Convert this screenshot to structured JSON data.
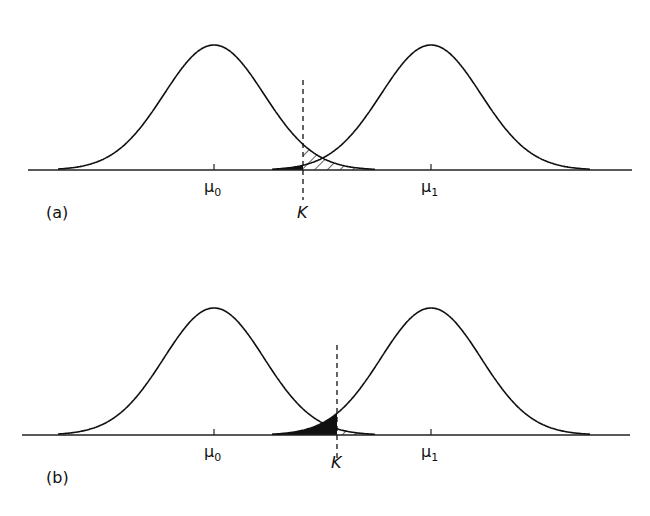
{
  "figure": {
    "colors": {
      "ink": "#111111",
      "background": "#ffffff"
    },
    "legend_semantics": {
      "black_area": "type II error region (beta) under the mu_1 distribution left of K",
      "hatched_area": "type I error region (alpha) under the mu_0 distribution right of K"
    },
    "panels": [
      {
        "id": "a",
        "label": "(a)",
        "mu0_label": "μ",
        "mu0_sub": "0",
        "mu1_label": "μ",
        "mu1_sub": "1",
        "k_label": "K",
        "geometry": {
          "baseline_y": 170,
          "peak_height": 125,
          "sigma": 50,
          "mu0_x": 214,
          "mu1_x": 431,
          "k_x": 303,
          "axis_x0": 28,
          "axis_x1": 632,
          "curve0_x0": 58,
          "curve0_x1": 375,
          "curve1_x0": 272,
          "curve1_x1": 590,
          "k_y0": 80,
          "k_y1": 200,
          "label_y": 218
        }
      },
      {
        "id": "b",
        "label": "(b)",
        "mu0_label": "μ",
        "mu0_sub": "0",
        "mu1_label": "μ",
        "mu1_sub": "1",
        "k_label": "K",
        "geometry": {
          "baseline_y": 435,
          "peak_height": 127,
          "sigma": 50,
          "mu0_x": 214,
          "mu1_x": 431,
          "k_x": 337,
          "axis_x0": 22,
          "axis_x1": 630,
          "curve0_x0": 58,
          "curve0_x1": 375,
          "curve1_x0": 272,
          "curve1_x1": 590,
          "k_y0": 345,
          "k_y1": 462,
          "label_y": 468
        }
      }
    ]
  }
}
